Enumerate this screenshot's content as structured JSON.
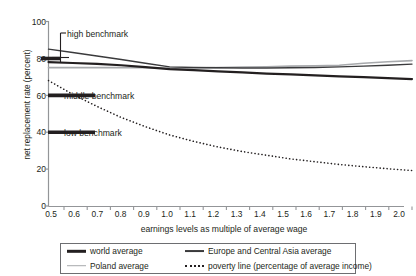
{
  "chart_data": {
    "type": "line",
    "title": "",
    "xlabel": "earnings levels as multiple of average wage",
    "ylabel": "net replacement rate (percent)",
    "xlim": [
      0.5,
      2.0
    ],
    "ylim": [
      0,
      100
    ],
    "grid": false,
    "legend_position": "bottom",
    "xticks": [
      "0.5",
      "0.6",
      "0.7",
      "0.8",
      "0.9",
      "1.0",
      "1.1",
      "1.2",
      "1.3",
      "1.4",
      "1.5",
      "1.6",
      "1.7",
      "1.8",
      "1.9",
      "2.0"
    ],
    "yticks": [
      "0",
      "20",
      "40",
      "60",
      "80",
      "100"
    ],
    "x": [
      0.5,
      0.6,
      0.7,
      0.8,
      0.9,
      1.0,
      1.1,
      1.2,
      1.3,
      1.4,
      1.5,
      1.6,
      1.7,
      1.8,
      1.9,
      2.0
    ],
    "series": [
      {
        "name": "world average",
        "color": "#231f20",
        "style": "solid",
        "width": 2.2,
        "values": [
          78.0,
          77.5,
          77.0,
          76.3,
          75.3,
          74.2,
          73.6,
          73.0,
          72.4,
          71.8,
          71.3,
          70.8,
          70.3,
          69.8,
          69.3,
          68.8
        ]
      },
      {
        "name": "Europe and Central Asia average",
        "color": "#3a3a3c",
        "style": "solid",
        "width": 1.4,
        "values": [
          85.0,
          83.2,
          81.3,
          79.4,
          77.4,
          75.4,
          75.1,
          74.9,
          74.8,
          74.8,
          74.9,
          75.1,
          75.4,
          75.8,
          76.3,
          76.9
        ]
      },
      {
        "name": "Poland average",
        "color": "#a7a9ac",
        "style": "solid",
        "width": 1.6,
        "values": [
          75.0,
          75.0,
          75.0,
          75.0,
          74.9,
          74.7,
          74.8,
          75.0,
          75.3,
          75.5,
          75.8,
          76.0,
          76.3,
          77.4,
          78.2,
          78.8
        ]
      },
      {
        "name": "poverty line (percentage of average income)",
        "color": "#231f20",
        "style": "dotted",
        "width": 1.6,
        "values": [
          68.0,
          60.5,
          54.0,
          48.0,
          43.0,
          38.5,
          35.0,
          32.0,
          29.5,
          27.5,
          25.5,
          24.0,
          22.5,
          21.3,
          20.2,
          19.2
        ]
      }
    ],
    "benchmarks": [
      {
        "name": "high benchmark",
        "value": 80,
        "label": "high benchmark"
      },
      {
        "name": "middle benchmark",
        "value": 60,
        "label": "middle benchmark"
      },
      {
        "name": "low benchmark",
        "value": 40,
        "label": "low benchmark"
      }
    ]
  },
  "axes": {
    "y_title": "net replacement rate (percent)",
    "x_title": "earnings levels as multiple of average wage",
    "y_ticks": [
      "100",
      "80",
      "60",
      "40",
      "20",
      "0"
    ],
    "x_ticks": [
      "0.5",
      "0.6",
      "0.7",
      "0.8",
      "0.9",
      "1.0",
      "1.1",
      "1.2",
      "1.3",
      "1.4",
      "1.5",
      "1.6",
      "1.7",
      "1.8",
      "1.9",
      "2.0"
    ]
  },
  "annotations": {
    "high": "high benchmark",
    "middle": "middle benchmark",
    "low": "low benchmark"
  },
  "legend": {
    "items": [
      {
        "label": "world average"
      },
      {
        "label": "Europe and Central Asia average"
      },
      {
        "label": "Poland average"
      },
      {
        "label": "poverty line (percentage of average income)"
      }
    ]
  }
}
